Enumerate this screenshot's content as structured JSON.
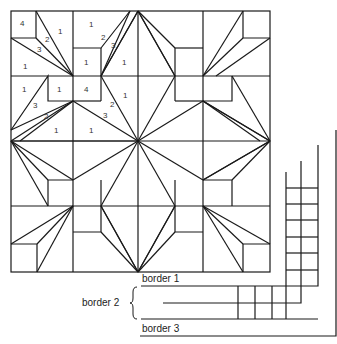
{
  "diagram": {
    "line_color": "#1a1a1a",
    "background": "#ffffff",
    "patch_labels": [
      {
        "text": "4",
        "x": 20,
        "y": 20
      },
      {
        "text": "1",
        "x": 58,
        "y": 28
      },
      {
        "text": "2",
        "x": 45,
        "y": 36
      },
      {
        "text": "3",
        "x": 37,
        "y": 46
      },
      {
        "text": "1",
        "x": 23,
        "y": 63
      },
      {
        "text": "1",
        "x": 89,
        "y": 21
      },
      {
        "text": "2",
        "x": 101,
        "y": 34
      },
      {
        "text": "3",
        "x": 111,
        "y": 42
      },
      {
        "text": "1",
        "x": 84,
        "y": 59
      },
      {
        "text": "1",
        "x": 122,
        "y": 59
      },
      {
        "text": "1",
        "x": 22,
        "y": 86
      },
      {
        "text": "1",
        "x": 57,
        "y": 86
      },
      {
        "text": "4",
        "x": 84,
        "y": 86
      },
      {
        "text": "1",
        "x": 123,
        "y": 92
      },
      {
        "text": "3",
        "x": 33,
        "y": 102
      },
      {
        "text": "2",
        "x": 110,
        "y": 101
      },
      {
        "text": "2",
        "x": 44,
        "y": 113
      },
      {
        "text": "3",
        "x": 103,
        "y": 112
      },
      {
        "text": "1",
        "x": 54,
        "y": 127
      },
      {
        "text": "1",
        "x": 89,
        "y": 127
      }
    ],
    "border_labels": {
      "border1": "border 1",
      "border2": "border 2",
      "border3": "border 3"
    }
  }
}
